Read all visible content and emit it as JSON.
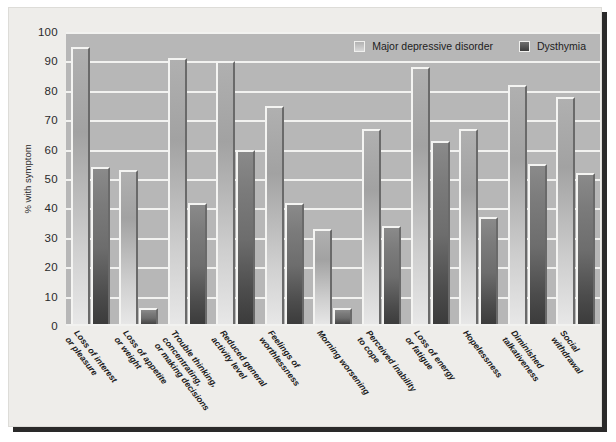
{
  "chart_data": {
    "type": "bar",
    "title": "",
    "xlabel": "",
    "ylabel": "% with symptom",
    "ylim": [
      0,
      100
    ],
    "ytick_step": 10,
    "yticks": [
      100,
      90,
      80,
      70,
      60,
      50,
      40,
      30,
      20,
      10,
      0
    ],
    "grid": true,
    "legend_position": "top-right",
    "categories": [
      "Loss of interest or pleasure",
      "Loss of appetite or weight",
      "Trouble thinking, concentrating, or making decisions",
      "Reduced general activity level",
      "Feelings of worthlessness",
      "Morning worsening",
      "Perceived inability to cope",
      "Loss of energy or fatigue",
      "Hopelessness",
      "Diminished talkativeness",
      "Social withdrawal"
    ],
    "category_lines": [
      [
        "Loss of interest",
        "or pleasure"
      ],
      [
        "Loss of appetite",
        "or weight"
      ],
      [
        "Trouble thinking,",
        "concentrating,",
        "or making decisions"
      ],
      [
        "Reduced general",
        "activity level"
      ],
      [
        "Feelings of",
        "worthlessness"
      ],
      [
        "Morning worsening"
      ],
      [
        "Perceived inability",
        "to cope"
      ],
      [
        "Loss of energy",
        "or fatigue"
      ],
      [
        "Hopelessness"
      ],
      [
        "Diminished",
        "talkativeness"
      ],
      [
        "Social",
        "withdrawal"
      ]
    ],
    "series": [
      {
        "name": "Major depressive disorder",
        "color": "#bfbfbf",
        "values": [
          95,
          53,
          91,
          90,
          75,
          33,
          67,
          88,
          67,
          82,
          78
        ]
      },
      {
        "name": "Dysthymia",
        "color": "#4a4a4a",
        "values": [
          54,
          6,
          42,
          60,
          42,
          6,
          34,
          63,
          37,
          55,
          52
        ]
      }
    ]
  },
  "legend": {
    "entries": [
      {
        "label": "Major depressive disorder",
        "swatch": "mdd"
      },
      {
        "label": "Dysthymia",
        "swatch": "dys"
      }
    ]
  },
  "colors": {
    "plot_background": "#b7b7b7",
    "figure_background": "#eeedea",
    "gridline": "#f2f2f0",
    "text": "#1a1a1a",
    "shadow": "#2a2a2a"
  }
}
